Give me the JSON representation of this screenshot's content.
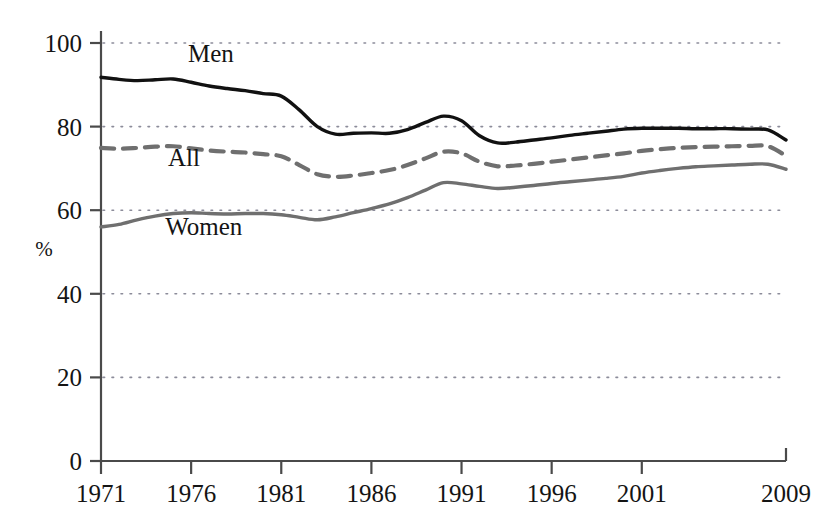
{
  "chart_data": {
    "type": "line",
    "title": "",
    "xlabel": "",
    "ylabel": "%",
    "xlim": [
      1971,
      2009
    ],
    "ylim": [
      0,
      100
    ],
    "grid": true,
    "legend_position": "inline-labels",
    "x_ticks": [
      "1971",
      "1976",
      "1981",
      "1986",
      "1991",
      "1996",
      "2001",
      "2009"
    ],
    "x_tick_values": [
      1971,
      1976,
      1981,
      1986,
      1991,
      1996,
      2001,
      2009
    ],
    "y_ticks": [
      "0",
      "20",
      "40",
      "60",
      "80",
      "100"
    ],
    "y_tick_values": [
      0,
      20,
      40,
      60,
      80,
      100
    ],
    "x": [
      1971,
      1972,
      1973,
      1974,
      1975,
      1976,
      1977,
      1978,
      1979,
      1980,
      1981,
      1982,
      1983,
      1984,
      1985,
      1986,
      1987,
      1988,
      1989,
      1990,
      1991,
      1992,
      1993,
      1994,
      1995,
      1996,
      1997,
      1998,
      1999,
      2000,
      2001,
      2002,
      2003,
      2004,
      2005,
      2006,
      2007,
      2008,
      2009
    ],
    "series": [
      {
        "name": "Men",
        "color": "#111111",
        "style": "solid",
        "label": "Men",
        "label_x": 1977.1,
        "label_y": 95.5,
        "values": [
          91.8,
          91.3,
          91.0,
          91.2,
          91.4,
          90.6,
          89.7,
          89.1,
          88.6,
          87.9,
          87.3,
          84.0,
          80.0,
          78.2,
          78.4,
          78.5,
          78.4,
          79.3,
          81.0,
          82.5,
          81.4,
          77.8,
          76.1,
          76.3,
          76.8,
          77.3,
          77.9,
          78.4,
          78.9,
          79.4,
          79.6,
          79.6,
          79.6,
          79.5,
          79.5,
          79.5,
          79.4,
          79.2,
          76.8
        ]
      },
      {
        "name": "All",
        "color": "#6f6f6f",
        "style": "dashed",
        "label": "All",
        "label_x": 1975.6,
        "label_y": 70.5,
        "values": [
          74.9,
          74.7,
          74.9,
          75.2,
          75.3,
          74.8,
          74.3,
          74.0,
          73.8,
          73.4,
          72.9,
          70.8,
          68.6,
          68.0,
          68.3,
          68.9,
          69.6,
          70.8,
          72.4,
          74.0,
          73.6,
          71.6,
          70.5,
          70.7,
          71.1,
          71.6,
          72.1,
          72.6,
          73.1,
          73.6,
          74.2,
          74.6,
          74.9,
          75.1,
          75.2,
          75.3,
          75.4,
          75.3,
          73.0
        ]
      },
      {
        "name": "Women",
        "color": "#6f6f6f",
        "style": "solid",
        "label": "Women",
        "label_x": 1976.7,
        "label_y": 54.0,
        "values": [
          56.0,
          56.6,
          57.7,
          58.6,
          59.2,
          59.4,
          59.2,
          59.1,
          59.2,
          59.2,
          58.9,
          58.3,
          57.7,
          58.4,
          59.4,
          60.4,
          61.5,
          63.0,
          64.8,
          66.6,
          66.3,
          65.7,
          65.2,
          65.5,
          65.9,
          66.4,
          66.8,
          67.2,
          67.6,
          68.1,
          68.9,
          69.5,
          70.0,
          70.4,
          70.6,
          70.8,
          71.0,
          71.0,
          69.8
        ]
      }
    ]
  },
  "axis": {
    "y_axis_name": "percentage-axis",
    "x_axis_name": "year-axis"
  }
}
